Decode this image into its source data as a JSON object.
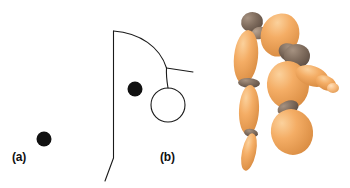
{
  "figure": {
    "width": 350,
    "height": 188,
    "background_color": "#ffffff",
    "panels": [
      {
        "id": "a",
        "label": "(a)",
        "label_position": {
          "x": 12,
          "y": 151
        },
        "description": "isolated filled black dot on plain white background",
        "elements": [
          {
            "name": "black-dot",
            "shape": "filled-circle",
            "cx": 44,
            "cy": 139,
            "r": 7.5,
            "fill": "#111111"
          }
        ]
      },
      {
        "id": "b",
        "label": "(b)",
        "label_position": {
          "x": 82,
          "y": 151
        },
        "description": "line-drawing contour outline with a filled black dot and an open circle",
        "stroke_color": "#1a1a1a",
        "stroke_width": 1.1,
        "elements": [
          {
            "name": "contour-outline",
            "shape": "path",
            "path": "M 113.5 31 L 113.5 158 L 105 181"
          },
          {
            "name": "contour-arc",
            "shape": "path",
            "path": "M 113.5 31 C 140 33 160 47 166.5 68"
          },
          {
            "name": "branch-line",
            "shape": "path",
            "path": "M 166.5 68 L 193 72"
          },
          {
            "name": "stem-line",
            "shape": "path",
            "path": "M 166.5 68 C 166 76 167 82 168 88"
          },
          {
            "name": "open-circle",
            "shape": "circle",
            "cx": 168,
            "cy": 105,
            "r": 17,
            "fill": "none"
          },
          {
            "name": "black-dot",
            "shape": "filled-circle",
            "cx": 135,
            "cy": 89,
            "r": 7.5,
            "fill": "#111111"
          }
        ]
      },
      {
        "id": "c",
        "label": "(c)",
        "label_position": {
          "x": 199,
          "y": 151
        },
        "description": "rendered wooden artist mannequin in a bent-over pose, orange-tan limbs with dark brown ball joints",
        "colors": {
          "limb_light": "#f7bd7a",
          "limb_base": "#f0a45a",
          "limb_shade": "#d88b44",
          "joint_dark": "#7d6a5c",
          "joint_light": "#9c8878",
          "outline": "#c98744"
        },
        "parts": [
          {
            "name": "head-sphere",
            "cx": 252,
            "cy": 22,
            "rx": 11,
            "ry": 10,
            "rot": -12,
            "color": "joint_dark"
          },
          {
            "name": "neck-joint",
            "cx": 259,
            "cy": 33,
            "rx": 8,
            "ry": 6,
            "rot": -20,
            "color": "joint_light"
          },
          {
            "name": "upper-arm-left",
            "cx": 246,
            "cy": 57,
            "rx": 12,
            "ry": 27,
            "rot": 6,
            "color": "limb_base"
          },
          {
            "name": "elbow-joint-left",
            "cx": 249,
            "cy": 83,
            "rx": 11,
            "ry": 5,
            "rot": 4,
            "color": "joint_dark"
          },
          {
            "name": "forearm-left",
            "cx": 249,
            "cy": 110,
            "rx": 10,
            "ry": 25,
            "rot": 3,
            "color": "limb_base"
          },
          {
            "name": "wrist-joint-left",
            "cx": 251,
            "cy": 133,
            "rx": 7,
            "ry": 4,
            "rot": 10,
            "color": "joint_dark"
          },
          {
            "name": "hand-foot-left",
            "cx": 249,
            "cy": 152,
            "rx": 7,
            "ry": 19,
            "rot": 12,
            "color": "limb_base"
          },
          {
            "name": "torso-upper",
            "cx": 280,
            "cy": 35,
            "rx": 19,
            "ry": 22,
            "rot": 22,
            "color": "limb_base"
          },
          {
            "name": "shoulder-joint",
            "cx": 290,
            "cy": 53,
            "rx": 12,
            "ry": 9,
            "rot": 30,
            "color": "joint_dark"
          },
          {
            "name": "head-sphere-2",
            "cx": 297,
            "cy": 56,
            "rx": 13,
            "ry": 12,
            "rot": 0,
            "color": "joint_dark"
          },
          {
            "name": "torso-lower",
            "cx": 288,
            "cy": 85,
            "rx": 21,
            "ry": 24,
            "rot": -6,
            "color": "limb_base"
          },
          {
            "name": "upper-arm-right",
            "cx": 312,
            "cy": 76,
            "rx": 17,
            "ry": 10,
            "rot": 18,
            "color": "limb_base"
          },
          {
            "name": "forearm-right",
            "cx": 326,
            "cy": 83,
            "rx": 11,
            "ry": 7,
            "rot": 24,
            "color": "limb_base"
          },
          {
            "name": "hand-right",
            "cx": 333,
            "cy": 88,
            "rx": 6,
            "ry": 5,
            "rot": 0,
            "color": "limb_light"
          },
          {
            "name": "hip-joint",
            "cx": 288,
            "cy": 108,
            "rx": 11,
            "ry": 7,
            "rot": -22,
            "color": "joint_dark"
          },
          {
            "name": "thigh",
            "cx": 292,
            "cy": 132,
            "rx": 21,
            "ry": 23,
            "rot": -14,
            "color": "limb_base"
          }
        ]
      }
    ]
  }
}
